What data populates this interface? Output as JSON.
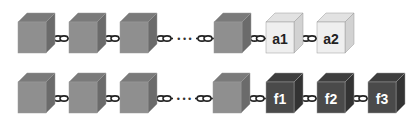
{
  "colors": {
    "gray_front": "#8f8f8f",
    "gray_top": "#7a7a7a",
    "gray_side": "#6b6b6b",
    "light_front": "#efefef",
    "light_top": "#e2e2e2",
    "light_side": "#d2d2d2",
    "light_label": "#222222",
    "dark_front": "#4a4a4a",
    "dark_top": "#3e3e3e",
    "dark_side": "#333333",
    "dark_label": "#ffffff",
    "chain": "#222222",
    "ellipsis": "#333333"
  },
  "rows": [
    {
      "name": "top-chain",
      "cubes": [
        {
          "x": 18,
          "type": "gray",
          "label": ""
        },
        {
          "x": 69,
          "type": "gray",
          "label": ""
        },
        {
          "x": 120,
          "type": "gray",
          "label": ""
        },
        {
          "x": 214,
          "type": "gray",
          "label": ""
        },
        {
          "x": 266,
          "type": "light",
          "label": "a1"
        },
        {
          "x": 317,
          "type": "light",
          "label": "a2"
        }
      ],
      "y": 22,
      "ellipsis_after_index": 2,
      "ellipsis": "• • •"
    },
    {
      "name": "bottom-chain",
      "cubes": [
        {
          "x": 18,
          "type": "gray",
          "label": ""
        },
        {
          "x": 69,
          "type": "gray",
          "label": ""
        },
        {
          "x": 120,
          "type": "gray",
          "label": ""
        },
        {
          "x": 213,
          "type": "gray",
          "label": ""
        },
        {
          "x": 266,
          "type": "dark",
          "label": "f1"
        },
        {
          "x": 317,
          "type": "dark",
          "label": "f2"
        },
        {
          "x": 368,
          "type": "dark",
          "label": "f3"
        }
      ],
      "y": 82,
      "ellipsis_after_index": 2,
      "ellipsis": "• • •"
    }
  ]
}
